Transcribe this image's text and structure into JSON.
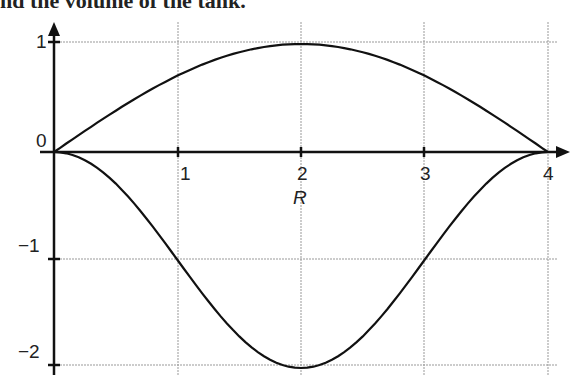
{
  "caption": "nd the volume of the tank.",
  "chart_data": {
    "type": "line",
    "title": "",
    "xlabel": "R",
    "ylabel": "",
    "xlim": [
      0,
      4
    ],
    "ylim": [
      -2,
      1
    ],
    "x_ticks": [
      "1",
      "2",
      "3",
      "4"
    ],
    "y_ticks": [
      "1",
      "0",
      "−1",
      "−2"
    ],
    "grid": true,
    "series": [
      {
        "name": "upper curve",
        "x": [
          0,
          0.5,
          1,
          1.5,
          2,
          2.5,
          3,
          3.5,
          4
        ],
        "values": [
          0,
          0.38,
          0.71,
          0.92,
          1,
          0.92,
          0.71,
          0.38,
          0
        ]
      },
      {
        "name": "lower curve",
        "x": [
          0,
          0.5,
          1,
          1.5,
          2,
          2.5,
          3,
          3.5,
          4
        ],
        "values": [
          0,
          -0.29,
          -1,
          -1.71,
          -2,
          -1.71,
          -1,
          -0.29,
          0
        ]
      }
    ]
  }
}
